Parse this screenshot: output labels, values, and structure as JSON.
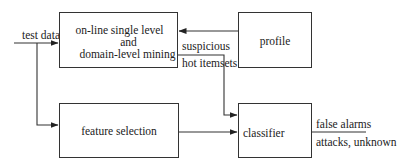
{
  "diagram": {
    "input_label": "test data",
    "nodes": {
      "mining": {
        "lines": [
          "on-line single level",
          "and",
          "domain-level mining"
        ]
      },
      "profile": {
        "label": "profile"
      },
      "feature_selection": {
        "label": "feature selection"
      },
      "classifier": {
        "label": "classifier"
      }
    },
    "edge_labels": {
      "suspicious": "suspicious",
      "hot_itemsets": "hot itemsets"
    },
    "outputs": {
      "top": "false alarms",
      "bottom": "attacks, unknown"
    },
    "edges": [
      {
        "from": "test data",
        "to": "mining"
      },
      {
        "from": "test data",
        "to": "feature_selection"
      },
      {
        "from": "profile",
        "to": "mining"
      },
      {
        "from": "mining",
        "to": "classifier",
        "label": "suspicious hot itemsets"
      },
      {
        "from": "feature_selection",
        "to": "classifier"
      },
      {
        "from": "classifier",
        "to": "outputs"
      }
    ]
  }
}
